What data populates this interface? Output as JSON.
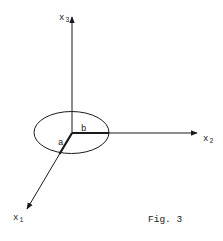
{
  "figure": {
    "caption": "Fig. 3",
    "axes": {
      "x1": {
        "base": "x",
        "sub": "1"
      },
      "x2": {
        "base": "x",
        "sub": "2"
      },
      "x3": {
        "base": "x",
        "sub": "3"
      }
    },
    "segments": {
      "a": "a",
      "b": "b"
    },
    "colors": {
      "ink": "#1a1a1a",
      "background": "#ffffff"
    }
  }
}
